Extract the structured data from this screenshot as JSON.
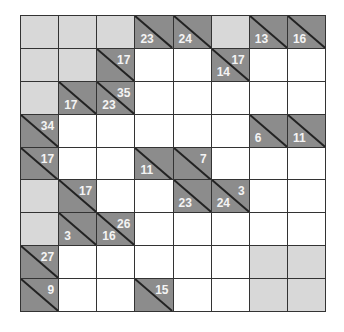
{
  "puzzle": {
    "type": "Kakuro",
    "cols": 8,
    "rows": 9,
    "colors": {
      "white": "#ffffff",
      "block": "#d8d8d8",
      "clue": "#8c8c8c",
      "clue_text": "#f4f4f4",
      "grid_line": "#333333"
    },
    "grid": [
      [
        {
          "t": "block"
        },
        {
          "t": "block"
        },
        {
          "t": "block"
        },
        {
          "t": "clue",
          "down": "23"
        },
        {
          "t": "clue",
          "down": "24"
        },
        {
          "t": "block"
        },
        {
          "t": "clue",
          "down": "13"
        },
        {
          "t": "clue",
          "down": "16"
        }
      ],
      [
        {
          "t": "block"
        },
        {
          "t": "block"
        },
        {
          "t": "clue",
          "right": "17"
        },
        {
          "t": "white"
        },
        {
          "t": "white"
        },
        {
          "t": "clue",
          "right": "17",
          "down": "14"
        },
        {
          "t": "white"
        },
        {
          "t": "white"
        }
      ],
      [
        {
          "t": "block"
        },
        {
          "t": "clue",
          "down": "17"
        },
        {
          "t": "clue",
          "right": "35",
          "down": "23"
        },
        {
          "t": "white"
        },
        {
          "t": "white"
        },
        {
          "t": "white"
        },
        {
          "t": "white"
        },
        {
          "t": "white"
        }
      ],
      [
        {
          "t": "clue",
          "right": "34"
        },
        {
          "t": "white"
        },
        {
          "t": "white"
        },
        {
          "t": "white"
        },
        {
          "t": "white"
        },
        {
          "t": "white"
        },
        {
          "t": "clue",
          "down": "6"
        },
        {
          "t": "clue",
          "down": "11"
        }
      ],
      [
        {
          "t": "clue",
          "right": "17"
        },
        {
          "t": "white"
        },
        {
          "t": "white"
        },
        {
          "t": "clue",
          "down": "11"
        },
        {
          "t": "clue",
          "right": "7"
        },
        {
          "t": "white"
        },
        {
          "t": "white"
        },
        {
          "t": "white"
        }
      ],
      [
        {
          "t": "block"
        },
        {
          "t": "clue",
          "right": "17"
        },
        {
          "t": "white"
        },
        {
          "t": "white"
        },
        {
          "t": "clue",
          "down": "23"
        },
        {
          "t": "clue",
          "right": "3",
          "down": "24"
        },
        {
          "t": "white"
        },
        {
          "t": "white"
        }
      ],
      [
        {
          "t": "block"
        },
        {
          "t": "clue",
          "down": "3"
        },
        {
          "t": "clue",
          "right": "26",
          "down": "16"
        },
        {
          "t": "white"
        },
        {
          "t": "white"
        },
        {
          "t": "white"
        },
        {
          "t": "white"
        },
        {
          "t": "white"
        }
      ],
      [
        {
          "t": "clue",
          "right": "27"
        },
        {
          "t": "white"
        },
        {
          "t": "white"
        },
        {
          "t": "white"
        },
        {
          "t": "white"
        },
        {
          "t": "white"
        },
        {
          "t": "block"
        },
        {
          "t": "block"
        }
      ],
      [
        {
          "t": "clue",
          "right": "9"
        },
        {
          "t": "white"
        },
        {
          "t": "white"
        },
        {
          "t": "clue",
          "right": "15"
        },
        {
          "t": "white"
        },
        {
          "t": "white"
        },
        {
          "t": "block"
        },
        {
          "t": "block"
        }
      ]
    ]
  }
}
